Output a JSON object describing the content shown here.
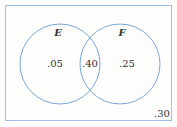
{
  "diagram": {
    "type": "venn",
    "colors": {
      "outline": "#7aa7d6",
      "text": "#333333",
      "background": "#fdfdfb"
    },
    "sets": [
      {
        "name": "E",
        "label": "E",
        "only_value": ".05"
      },
      {
        "name": "F",
        "label": "F",
        "only_value": ".25"
      }
    ],
    "intersection_value": ".40",
    "outside_value": ".30"
  }
}
